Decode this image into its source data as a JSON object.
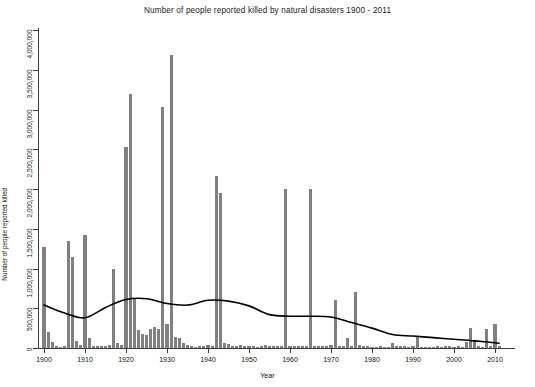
{
  "chart_data": {
    "type": "bar",
    "title": "Number of people reported killed by natural disasters 1900 - 2011",
    "xlabel": "Year",
    "ylabel": "Number of people reported killed",
    "xlim": [
      1899,
      2012
    ],
    "ylim": [
      0,
      4000000
    ],
    "grid": false,
    "legend": null,
    "xticks": [
      1900,
      1910,
      1920,
      1930,
      1940,
      1950,
      1960,
      1970,
      1980,
      1990,
      2000,
      2010
    ],
    "xtick_labels": [
      "1900",
      "1910",
      "1920",
      "1930",
      "1940",
      "1950",
      "1960",
      "1970",
      "1980",
      "1990",
      "2000",
      "2010"
    ],
    "yticks": [
      0,
      500000,
      1000000,
      1500000,
      2000000,
      2500000,
      3000000,
      3500000,
      4000000
    ],
    "ytick_labels": [
      "0",
      "500,000",
      "1,000,000",
      "1,500,000",
      "2,000,000",
      "2,500,000",
      "3,000,000",
      "3,500,000",
      "4,000,000"
    ],
    "bar_color": "#808080",
    "line_color": "#000000",
    "series": [
      {
        "name": "People reported killed",
        "type": "bar",
        "x": [
          1900,
          1901,
          1902,
          1903,
          1904,
          1905,
          1906,
          1907,
          1908,
          1909,
          1910,
          1911,
          1912,
          1913,
          1914,
          1915,
          1916,
          1917,
          1918,
          1919,
          1920,
          1921,
          1922,
          1923,
          1924,
          1925,
          1926,
          1927,
          1928,
          1929,
          1930,
          1931,
          1932,
          1933,
          1934,
          1935,
          1936,
          1937,
          1938,
          1939,
          1940,
          1941,
          1942,
          1943,
          1944,
          1945,
          1946,
          1947,
          1948,
          1949,
          1950,
          1951,
          1952,
          1953,
          1954,
          1955,
          1956,
          1957,
          1958,
          1959,
          1960,
          1961,
          1962,
          1963,
          1964,
          1965,
          1966,
          1967,
          1968,
          1969,
          1970,
          1971,
          1972,
          1973,
          1974,
          1975,
          1976,
          1977,
          1978,
          1979,
          1980,
          1981,
          1982,
          1983,
          1984,
          1985,
          1986,
          1987,
          1988,
          1989,
          1990,
          1991,
          1992,
          1993,
          1994,
          1995,
          1996,
          1997,
          1998,
          1999,
          2000,
          2001,
          2002,
          2003,
          2004,
          2005,
          2006,
          2007,
          2008,
          2009,
          2010,
          2011
        ],
        "values": [
          1267000,
          200000,
          80000,
          30000,
          10000,
          25000,
          1350000,
          1150000,
          90000,
          40000,
          1420000,
          120000,
          30000,
          20000,
          20000,
          30000,
          40000,
          1000000,
          60000,
          40000,
          2530000,
          3200000,
          620000,
          230000,
          180000,
          160000,
          240000,
          260000,
          240000,
          3030000,
          300000,
          3690000,
          140000,
          120000,
          60000,
          40000,
          20000,
          10000,
          30000,
          30000,
          40000,
          30000,
          2170000,
          1950000,
          60000,
          50000,
          30000,
          30000,
          40000,
          30000,
          20000,
          30000,
          10000,
          20000,
          40000,
          20000,
          20000,
          20000,
          30000,
          2000000,
          30000,
          20000,
          20000,
          20000,
          20000,
          2000000,
          20000,
          20000,
          20000,
          30000,
          40000,
          600000,
          30000,
          20000,
          130000,
          30000,
          700000,
          40000,
          30000,
          20000,
          10000,
          10000,
          20000,
          10000,
          10000,
          60000,
          20000,
          20000,
          30000,
          10000,
          20000,
          150000,
          10000,
          10000,
          10000,
          10000,
          20000,
          10000,
          20000,
          30000,
          10000,
          30000,
          10000,
          70000,
          250000,
          100000,
          30000,
          10000,
          240000,
          20000,
          300000,
          30000
        ]
      },
      {
        "name": "Smoothed trend",
        "type": "line",
        "x": [
          1900,
          1905,
          1910,
          1915,
          1920,
          1925,
          1930,
          1935,
          1940,
          1945,
          1950,
          1955,
          1960,
          1965,
          1970,
          1975,
          1980,
          1985,
          1990,
          1995,
          2000,
          2005,
          2011
        ],
        "values": [
          540000,
          440000,
          380000,
          510000,
          610000,
          620000,
          560000,
          540000,
          600000,
          590000,
          530000,
          420000,
          400000,
          400000,
          390000,
          320000,
          250000,
          170000,
          150000,
          130000,
          110000,
          90000,
          60000
        ]
      }
    ]
  }
}
